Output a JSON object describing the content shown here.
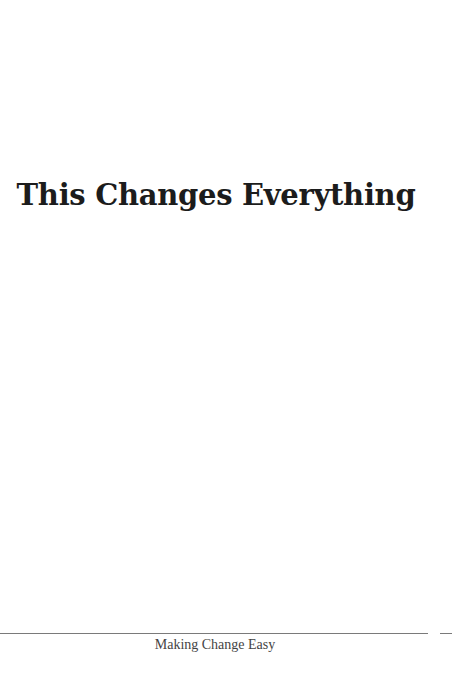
{
  "page": {
    "title": "This Changes Everything",
    "footer": "Making Change Easy"
  }
}
